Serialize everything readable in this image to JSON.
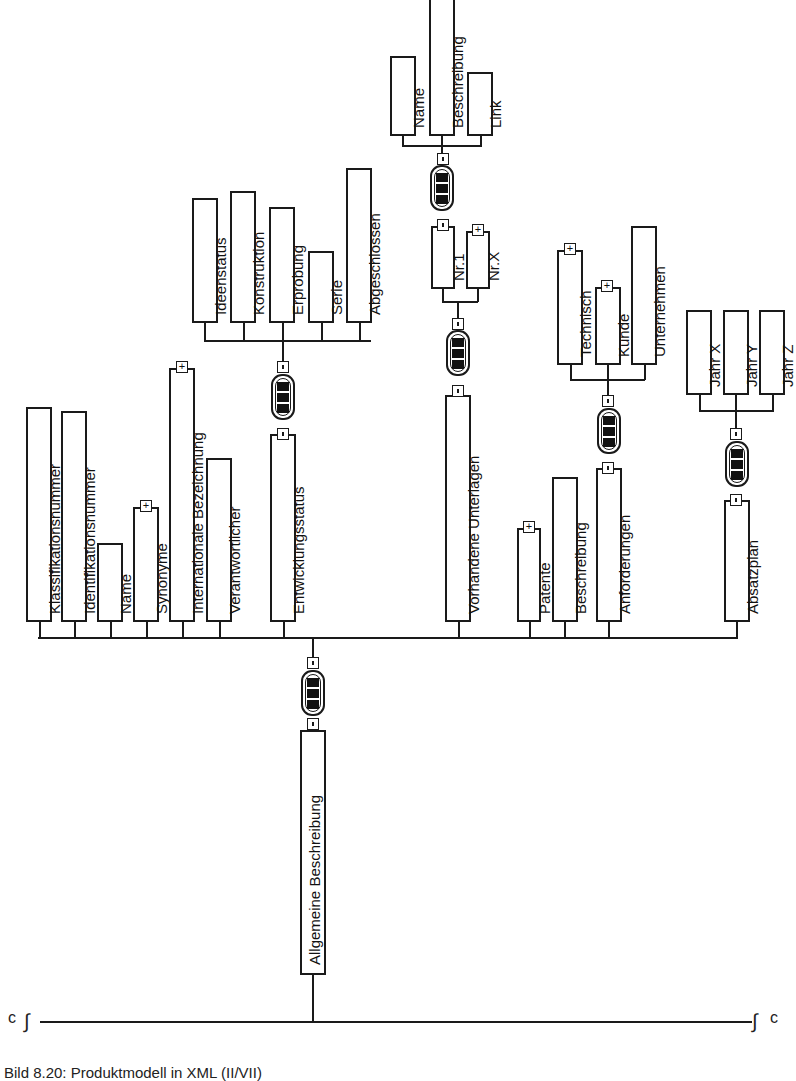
{
  "diagram": {
    "title": "Produktmodell in XML (II/VII)",
    "caption": "Bild 8.20:   Produktmodell in XML (II/VII)",
    "orientation": "rotated-90-text-bottom-to-top",
    "root": {
      "label": "Allgemeine Beschreibung",
      "connector": "sequence",
      "children": [
        {
          "label": "Klassifikationsnummer",
          "expandable": false
        },
        {
          "label": "Identifikationsnummer",
          "expandable": false
        },
        {
          "label": "Name",
          "expandable": false
        },
        {
          "label": "Synonyme",
          "expandable": true
        },
        {
          "label": "Internationale Bezeichnung",
          "expandable": true
        },
        {
          "label": "Verantwortlicher",
          "expandable": false
        },
        {
          "label": "Entwicklungsstatus",
          "connector": "sequence",
          "children": [
            {
              "label": "Ideenstatus"
            },
            {
              "label": "Konstruktion"
            },
            {
              "label": "Erprobung"
            },
            {
              "label": "Serie"
            },
            {
              "label": "Abgeschlossen"
            }
          ]
        },
        {
          "label": "Vorhandene Unterlagen",
          "connector": "sequence",
          "children": [
            {
              "label": "Nr.1",
              "connector": "sequence",
              "children": [
                {
                  "label": "Name"
                },
                {
                  "label": "Beschreibung"
                },
                {
                  "label": "Link"
                }
              ]
            },
            {
              "label": "Nr.X",
              "expandable": true
            }
          ]
        },
        {
          "label": "Patente",
          "expandable": true
        },
        {
          "label": "Beschreibung",
          "expandable": false
        },
        {
          "label": "Anforderungen",
          "connector": "sequence",
          "children": [
            {
              "label": "Technisch",
              "expandable": true
            },
            {
              "label": "Kunde",
              "expandable": true
            },
            {
              "label": "Unternehmen",
              "expandable": false
            }
          ]
        },
        {
          "label": "Absatzplan",
          "connector": "sequence",
          "children": [
            {
              "label": "Jahr X"
            },
            {
              "label": "Jahr Y"
            },
            {
              "label": "Jahr Z"
            }
          ]
        }
      ]
    },
    "labels": {
      "klass": "Klassifikationsnummer",
      "ident": "Identifikationsnummer",
      "name": "Name",
      "syn": "Synonyme",
      "intl": "Internationale Bezeichnung",
      "verant": "Verantwortlicher",
      "entw": "Entwicklungsstatus",
      "ideen": "Ideenstatus",
      "konst": "Konstruktion",
      "erpr": "Erprobung",
      "serie": "Serie",
      "abge": "Abgeschlossen",
      "vorh": "Vorhandene Unterlagen",
      "nr1": "Nr.1",
      "nrx": "Nr.X",
      "dname": "Name",
      "dbeschr": "Beschreibung",
      "dlink": "Link",
      "pat": "Patente",
      "beschr": "Beschreibung",
      "anf": "Anforderungen",
      "tech": "Technisch",
      "kunde": "Kunde",
      "untern": "Unternehmen",
      "absatz": "Absatzplan",
      "jx": "Jahr X",
      "jy": "Jahr Y",
      "jz": "Jahr Z",
      "root": "Allgemeine Beschreibung"
    },
    "symbols": {
      "plus": "+",
      "break_left": "∫",
      "break_right": "∫",
      "end_mark": "c"
    }
  }
}
